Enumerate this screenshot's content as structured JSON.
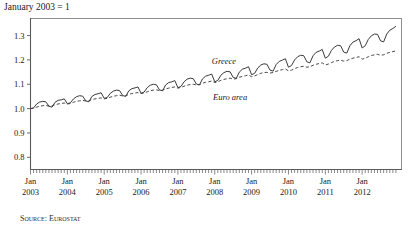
{
  "figure": {
    "title": "January 2003 = 1",
    "source_note": "Source: Eurostat"
  },
  "chart_data": {
    "type": "line",
    "title": "January 2003 = 1",
    "xlabel": "",
    "ylabel": "",
    "ylim": [
      0.75,
      1.37
    ],
    "xlim": [
      "2003-01",
      "2012-12"
    ],
    "grid": false,
    "legend_position": "inline-annotation",
    "ytick_labels": [
      "1.3",
      "1.2",
      "1.1",
      "1.0",
      "0.9",
      "0.8"
    ],
    "ytick_values": [
      1.3,
      1.2,
      1.1,
      1.0,
      0.9,
      0.8
    ],
    "xtick_month_label": "Jan",
    "xtick_years": [
      "2003",
      "2004",
      "2005",
      "2006",
      "2007",
      "2008",
      "2009",
      "2010",
      "2011",
      "2012"
    ],
    "minor_ticks": "monthly",
    "annotations": [
      {
        "text": "Greece",
        "x": "2008-04",
        "y": 1.185,
        "style": "italic"
      },
      {
        "text": "Euro area",
        "x": "2008-06",
        "y": 1.035,
        "style": "italic"
      }
    ],
    "series": [
      {
        "name": "Greece",
        "style": "solid",
        "color": "#3a3a3a",
        "values": [
          1.0,
          1.003,
          1.019,
          1.027,
          1.03,
          1.028,
          1.01,
          1.006,
          1.026,
          1.034,
          1.036,
          1.04,
          1.02,
          1.024,
          1.04,
          1.049,
          1.053,
          1.051,
          1.032,
          1.028,
          1.05,
          1.058,
          1.061,
          1.065,
          1.042,
          1.046,
          1.063,
          1.072,
          1.076,
          1.074,
          1.054,
          1.05,
          1.073,
          1.082,
          1.085,
          1.089,
          1.063,
          1.068,
          1.086,
          1.096,
          1.1,
          1.098,
          1.077,
          1.073,
          1.097,
          1.107,
          1.11,
          1.115,
          1.086,
          1.091,
          1.11,
          1.121,
          1.125,
          1.123,
          1.101,
          1.097,
          1.122,
          1.133,
          1.137,
          1.142,
          1.11,
          1.116,
          1.137,
          1.148,
          1.153,
          1.151,
          1.128,
          1.124,
          1.15,
          1.162,
          1.166,
          1.172,
          1.139,
          1.145,
          1.167,
          1.179,
          1.184,
          1.182,
          1.158,
          1.154,
          1.181,
          1.194,
          1.199,
          1.205,
          1.17,
          1.177,
          1.2,
          1.213,
          1.219,
          1.217,
          1.192,
          1.188,
          1.217,
          1.231,
          1.236,
          1.243,
          1.207,
          1.215,
          1.239,
          1.253,
          1.26,
          1.258,
          1.232,
          1.228,
          1.258,
          1.273,
          1.279,
          1.287,
          1.249,
          1.258,
          1.284,
          1.299,
          1.306,
          1.305,
          1.278,
          1.274,
          1.306,
          1.322,
          1.329,
          1.338
        ]
      },
      {
        "name": "Euro area",
        "style": "dashed",
        "color": "#4a4a4a",
        "values": [
          1.0,
          1.002,
          1.006,
          1.01,
          1.012,
          1.013,
          1.01,
          1.011,
          1.016,
          1.019,
          1.021,
          1.023,
          1.019,
          1.021,
          1.026,
          1.03,
          1.032,
          1.034,
          1.031,
          1.032,
          1.037,
          1.04,
          1.042,
          1.044,
          1.04,
          1.042,
          1.047,
          1.051,
          1.053,
          1.055,
          1.052,
          1.053,
          1.058,
          1.062,
          1.064,
          1.066,
          1.062,
          1.064,
          1.069,
          1.073,
          1.076,
          1.077,
          1.074,
          1.076,
          1.081,
          1.084,
          1.087,
          1.089,
          1.084,
          1.087,
          1.092,
          1.096,
          1.099,
          1.1,
          1.097,
          1.099,
          1.104,
          1.108,
          1.11,
          1.113,
          1.107,
          1.11,
          1.116,
          1.12,
          1.123,
          1.125,
          1.121,
          1.123,
          1.129,
          1.132,
          1.135,
          1.138,
          1.131,
          1.134,
          1.14,
          1.145,
          1.148,
          1.149,
          1.146,
          1.148,
          1.153,
          1.157,
          1.16,
          1.163,
          1.155,
          1.158,
          1.164,
          1.169,
          1.172,
          1.174,
          1.17,
          1.172,
          1.178,
          1.182,
          1.185,
          1.188,
          1.179,
          1.183,
          1.189,
          1.194,
          1.197,
          1.199,
          1.195,
          1.197,
          1.203,
          1.207,
          1.21,
          1.213,
          1.203,
          1.207,
          1.213,
          1.218,
          1.221,
          1.223,
          1.219,
          1.221,
          1.227,
          1.231,
          1.234,
          1.237
        ]
      }
    ]
  },
  "axes": {
    "frame_color": "#8a8a8a",
    "tick_color": "#6a6a6a"
  }
}
